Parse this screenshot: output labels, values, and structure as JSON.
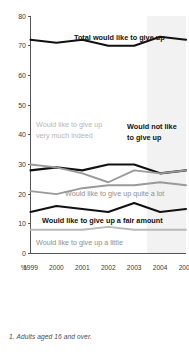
{
  "footnote": "1. Adults aged 16 and over.",
  "axis": {
    "y_unit_label": "%",
    "y_ticks": [
      0,
      10,
      20,
      30,
      40,
      50,
      60,
      70,
      80
    ],
    "x_ticks": [
      "1999",
      "2000",
      "2001",
      "2002",
      "2003",
      "2004",
      "2005"
    ]
  },
  "annotations": {
    "total": "Total would like to give up",
    "not_like_line1": "Would not like",
    "not_like_line2": "to give up",
    "very_much_line1": "Would like to give up",
    "very_much_line2": "very much indeed",
    "quite_a_lot": "Would like to give up quite a lot",
    "fair_amount": "Would like to give up a fair amount",
    "a_little": "Would like to give up a little"
  },
  "colors": {
    "dark": "#111111",
    "gray": "#9a9a9a",
    "light_gray": "#b9b9b9",
    "band": "#f2f2f2",
    "axis": "#555555"
  },
  "chart_data": {
    "type": "line",
    "title": "",
    "xlabel": "",
    "ylabel": "%",
    "x": [
      "1999",
      "2000",
      "2001",
      "2002",
      "2003",
      "2004",
      "2005"
    ],
    "ylim": [
      0,
      80
    ],
    "yticks": [
      0,
      10,
      20,
      30,
      40,
      50,
      60,
      70,
      80
    ],
    "grid": false,
    "legend": "inline-annotations",
    "shaded_x_band": [
      "2004",
      "2005"
    ],
    "series": [
      {
        "name": "Total would like to give up",
        "color": "#111111",
        "values": [
          72,
          71,
          72,
          70,
          70,
          73,
          72
        ]
      },
      {
        "name": "Would not like to give up",
        "color": "#111111",
        "values": [
          28,
          29,
          28,
          30,
          30,
          27,
          28
        ]
      },
      {
        "name": "Would like to give up very much indeed",
        "color": "#9a9a9a",
        "values": [
          30,
          29,
          27,
          24,
          28,
          27,
          28
        ]
      },
      {
        "name": "Would like to give up quite a lot",
        "color": "#9a9a9a",
        "values": [
          21,
          20,
          22,
          23,
          23,
          24,
          23
        ]
      },
      {
        "name": "Would like to give up a fair amount",
        "color": "#111111",
        "values": [
          14,
          16,
          15,
          14,
          17,
          14,
          15
        ]
      },
      {
        "name": "Would like to give up a little",
        "color": "#b9b9b9",
        "values": [
          8,
          8,
          8,
          9,
          8,
          8,
          8
        ]
      }
    ]
  }
}
